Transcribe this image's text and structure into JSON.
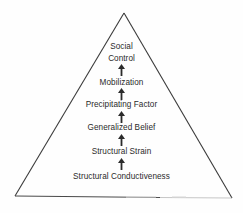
{
  "diagram": {
    "shape": "triangle",
    "stroke_color": "#3a3a3a",
    "text_color": "#2b2b2b",
    "background_color": "#fefefe",
    "apex": {
      "x": 124,
      "y": 13
    },
    "base_left": {
      "x": 15,
      "y": 196
    },
    "base_right": {
      "x": 232,
      "y": 198
    },
    "levels": [
      {
        "id": "social-control",
        "line1": "Social",
        "line2": "Control",
        "y": 41,
        "two_line": true
      },
      {
        "id": "mobilization",
        "line1": "Mobilization",
        "line2": "",
        "y": 78,
        "two_line": false
      },
      {
        "id": "precipitating-factor",
        "line1": "Precipitating Factor",
        "line2": "",
        "y": 100,
        "two_line": false
      },
      {
        "id": "generalized-belief",
        "line1": "Generalized Belief",
        "line2": "",
        "y": 123,
        "two_line": false
      },
      {
        "id": "structural-strain",
        "line1": "Structural Strain",
        "line2": "",
        "y": 147,
        "two_line": false
      },
      {
        "id": "structural-conductiveness",
        "line1": "Structural Conductiveness",
        "line2": "",
        "y": 172,
        "two_line": false
      }
    ],
    "arrows": [
      {
        "id": "arrow-mobilization-to-social-control",
        "y": 64,
        "direction": "up"
      },
      {
        "id": "arrow-precipitating-to-mobilization",
        "y": 88,
        "direction": "up"
      },
      {
        "id": "arrow-belief-to-precipitating",
        "y": 111,
        "direction": "up"
      },
      {
        "id": "arrow-strain-to-belief",
        "y": 134,
        "direction": "up"
      },
      {
        "id": "arrow-conductiveness-to-strain",
        "y": 158,
        "direction": "up"
      }
    ]
  }
}
